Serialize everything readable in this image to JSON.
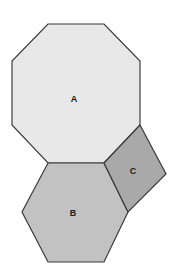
{
  "figure": {
    "background_color": "#ffffff",
    "width": 180,
    "height": 277,
    "stroke_color": "#3a3a3a",
    "stroke_width": 1.2,
    "shapes": [
      {
        "id": "octagon-a",
        "label": "A",
        "kind": "octagon",
        "sides": 8,
        "fill_color": "#e8e8e8",
        "label_x": 74,
        "label_y": 100,
        "points": "48,24 104,24 140,61 140,125 104,163 48,163 12,125 12,61"
      },
      {
        "id": "hexagon-b",
        "label": "B",
        "kind": "hexagon",
        "sides": 6,
        "fill_color": "#c2c2c2",
        "label_x": 73,
        "label_y": 214,
        "points": "48,163 104,163 128,212 104,262 48,262 22,212"
      },
      {
        "id": "square-c",
        "label": "C",
        "kind": "square",
        "sides": 4,
        "fill_color": "#a9a9a9",
        "label_x": 133,
        "label_y": 172,
        "points": "104,163 140,125 166,174 128,212"
      }
    ]
  }
}
